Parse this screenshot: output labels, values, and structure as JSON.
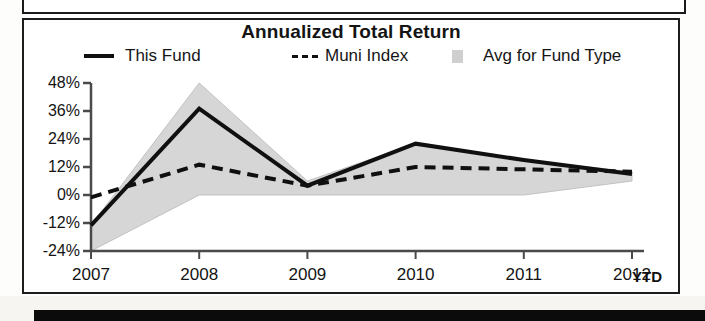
{
  "panel": {
    "title": "Annualized Total Return"
  },
  "legend": [
    {
      "label": "This Fund",
      "marker": "solid-line-swatch"
    },
    {
      "label": "Muni Index",
      "marker": "dashed-line-swatch"
    },
    {
      "label": "Avg for Fund Type",
      "marker": "shaded-area-swatch"
    }
  ],
  "axis": {
    "ytd_note": "YTD"
  },
  "chart_data": {
    "type": "line",
    "title": "Annualized Total Return",
    "xlabel": "",
    "ylabel": "",
    "x": [
      "2007",
      "2008",
      "2009",
      "2010",
      "2011",
      "2012"
    ],
    "categories": [
      "2007",
      "2008",
      "2009",
      "2010",
      "2011",
      "2012"
    ],
    "ylim": [
      -24,
      48
    ],
    "yticks": [
      48,
      36,
      24,
      12,
      0,
      -12,
      -24
    ],
    "ytick_labels": [
      "48%",
      "36%",
      "24%",
      "12%",
      "0%",
      "-12%",
      "-24%"
    ],
    "grid": false,
    "legend_position": "top",
    "series": [
      {
        "name": "This Fund",
        "style": "solid",
        "color": "#101010",
        "values": [
          -13,
          37,
          4,
          22,
          15,
          9
        ]
      },
      {
        "name": "Muni Index",
        "style": "dashed",
        "color": "#101010",
        "values": [
          -1,
          13,
          4,
          12,
          11,
          10
        ]
      },
      {
        "name": "Avg for Fund Type",
        "style": "band",
        "color": "#d4d4d4",
        "upper": [
          -13,
          48,
          6,
          22,
          15,
          10
        ],
        "lower": [
          -24,
          0,
          0,
          0,
          0,
          6
        ]
      }
    ],
    "annotations": [
      "YTD"
    ]
  }
}
